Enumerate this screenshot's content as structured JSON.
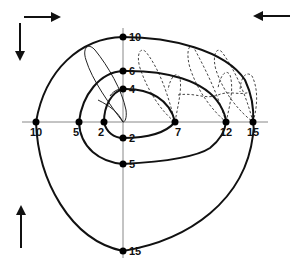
{
  "diagram": {
    "type": "nested-loop spiral diagram",
    "origin": {
      "x": 123,
      "y": 122
    },
    "axis_labels": {
      "left": [
        "10",
        "5",
        "2"
      ],
      "right": [
        "7",
        "12",
        "15"
      ],
      "up": [
        "10",
        "6",
        "4"
      ],
      "down": [
        "2",
        "5",
        "15"
      ]
    },
    "points": [
      {
        "id": "h10",
        "label": "10",
        "x": 36,
        "y": 122
      },
      {
        "id": "h5",
        "label": "5",
        "x": 79,
        "y": 122
      },
      {
        "id": "h2",
        "label": "2",
        "x": 104,
        "y": 122
      },
      {
        "id": "h7",
        "label": "7",
        "x": 175,
        "y": 122
      },
      {
        "id": "h12",
        "label": "12",
        "x": 226,
        "y": 122
      },
      {
        "id": "h15",
        "label": "15",
        "x": 253,
        "y": 122
      },
      {
        "id": "v10",
        "label": "10",
        "x": 123,
        "y": 37
      },
      {
        "id": "v6",
        "label": "6",
        "x": 123,
        "y": 71
      },
      {
        "id": "v4",
        "label": "4",
        "x": 123,
        "y": 89
      },
      {
        "id": "v2",
        "label": "2",
        "x": 123,
        "y": 138
      },
      {
        "id": "v5",
        "label": "5",
        "x": 123,
        "y": 164
      },
      {
        "id": "v15",
        "label": "15",
        "x": 123,
        "y": 251
      }
    ],
    "arrows": [
      {
        "name": "arrow-right",
        "direction": "right",
        "position": "top-left"
      },
      {
        "name": "arrow-down",
        "direction": "down",
        "position": "top-left"
      },
      {
        "name": "arrow-left",
        "direction": "left",
        "position": "top-right"
      },
      {
        "name": "arrow-up",
        "direction": "up",
        "position": "bottom-left"
      }
    ],
    "colors": {
      "line": "#111111",
      "axis": "#888888",
      "dashed": "#444444",
      "background": "#ffffff"
    }
  }
}
